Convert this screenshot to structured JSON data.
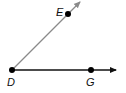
{
  "diagram": {
    "type": "angle",
    "points": {
      "D": {
        "label": "D",
        "x": 12,
        "y": 70
      },
      "E": {
        "label": "E",
        "x": 68,
        "y": 14
      },
      "G": {
        "label": "G",
        "x": 91,
        "y": 70
      }
    },
    "rays": [
      {
        "name": "ray-DE",
        "from": "D",
        "through": "E",
        "color": "#8a8a8a"
      },
      {
        "name": "ray-DG",
        "from": "D",
        "through": "G",
        "color": "#111111"
      }
    ],
    "colors": {
      "ray_DE": "#8a8a8a",
      "ray_DG": "#111111",
      "point": "#000000"
    }
  }
}
